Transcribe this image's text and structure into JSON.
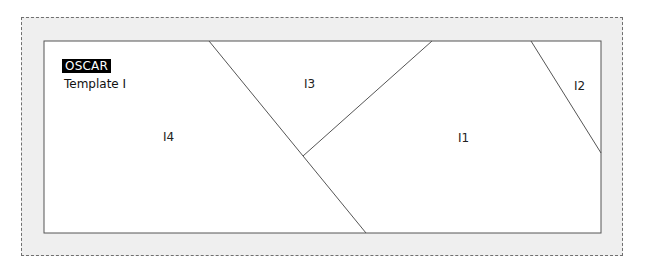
{
  "header": {
    "badge": "OSCAR",
    "subtitle": "Template I"
  },
  "panels": [
    {
      "id": "I1",
      "label": "I1"
    },
    {
      "id": "I2",
      "label": "I2"
    },
    {
      "id": "I3",
      "label": "I3"
    },
    {
      "id": "I4",
      "label": "I4"
    }
  ],
  "colors": {
    "frame_fill": "#efefef",
    "panel_fill": "#ffffff",
    "line": "#555555",
    "badge_bg": "#000000",
    "badge_text": "#ffffff"
  }
}
